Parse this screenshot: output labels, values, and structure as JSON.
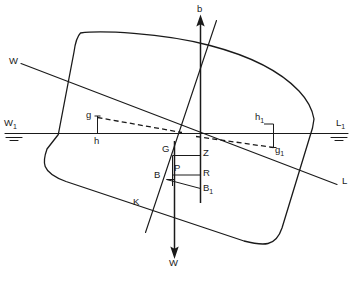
{
  "diagram": {
    "type": "naval-architecture-cross-section",
    "stroke_color": "#1a1a1a",
    "background_color": "#ffffff",
    "labels": {
      "buoyancy_axis": "b",
      "weight_arrow": "W",
      "waterline_w": "W",
      "waterline_l": "L",
      "waterline_w1": "W",
      "waterline_w1_sub": "1",
      "waterline_l1": "L",
      "waterline_l1_sub": "1",
      "offset_g": "g",
      "offset_h": "h",
      "offset_h1": "h",
      "offset_h1_sub": "1",
      "offset_g1": "g",
      "offset_g1_sub": "1",
      "point_g": "G",
      "point_z": "Z",
      "point_p": "P",
      "point_r": "R",
      "point_b": "B",
      "point_b1": "B",
      "point_b1_sub": "1",
      "point_k": "K"
    }
  }
}
